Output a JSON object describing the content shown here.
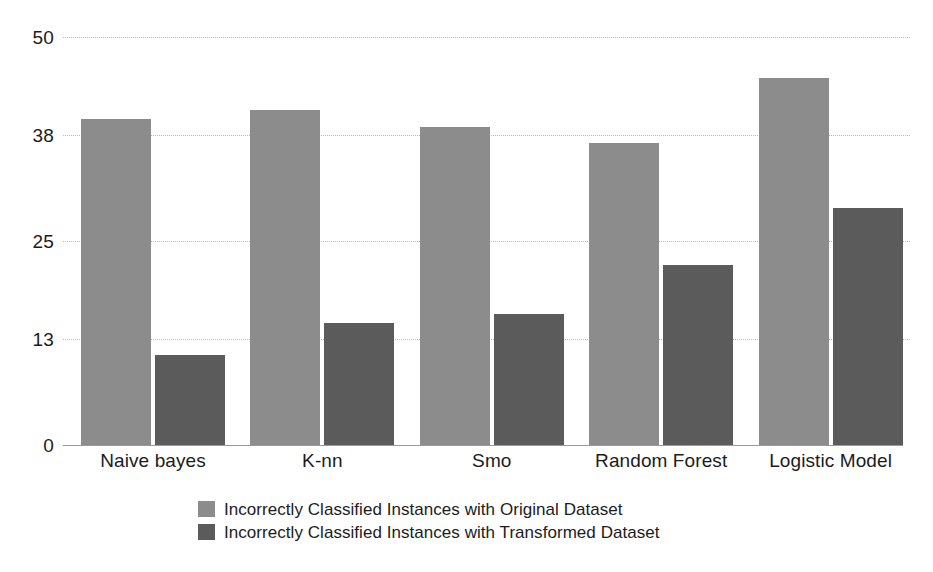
{
  "chart_data": {
    "type": "bar",
    "title": "",
    "subtitle": "",
    "xlabel": "",
    "ylabel": "",
    "categories": [
      "Naive bayes",
      "K-nn",
      "Smo",
      "Random Forest",
      "Logistic Model"
    ],
    "series": [
      {
        "name": "Incorrectly Classified Instances with Original Dataset",
        "color": "#8c8c8c",
        "values": [
          40,
          41,
          39,
          37,
          45
        ]
      },
      {
        "name": "Incorrectly Classified Instances with Transformed Dataset",
        "color": "#5b5b5b",
        "values": [
          11,
          15,
          16,
          22,
          29
        ]
      }
    ],
    "ylim": [
      0,
      50
    ],
    "yticks": [
      0,
      13,
      25,
      38,
      50
    ],
    "ytick_labels": [
      "0",
      "13",
      "25",
      "38",
      "50"
    ],
    "grid": true,
    "grid_style": "dotted-horizontal",
    "legend_position": "bottom-center",
    "background": "#ffffff",
    "axis_color": "#9a9a9a",
    "gridline_color": "#b9b9b9",
    "text_color": "#1c1c1c"
  },
  "axis": {
    "y_labels": [
      "50",
      "38",
      "25",
      "13",
      "0"
    ]
  },
  "legend": {
    "items": [
      {
        "label": "Incorrectly Classified Instances with Original Dataset",
        "swatch": "legend-swatch-original"
      },
      {
        "label": "Incorrectly Classified Instances with Transformed Dataset",
        "swatch": "legend-swatch-transformed"
      }
    ]
  }
}
